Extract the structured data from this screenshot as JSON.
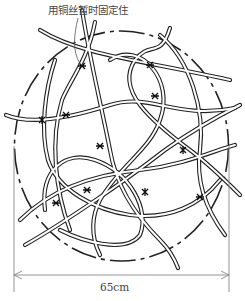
{
  "figure": {
    "annotation_label": "用铜丝暂时固定住",
    "dimension_label": "65cm",
    "colors": {
      "line": "#222222",
      "dim_line": "#888888",
      "background": "#ffffff"
    },
    "circle": {
      "cx": 121.5,
      "cy": 146,
      "rx": 107.5,
      "ry": 116,
      "style": "dashed"
    },
    "dimension": {
      "x1": 14,
      "x2": 229,
      "y": 275
    }
  }
}
